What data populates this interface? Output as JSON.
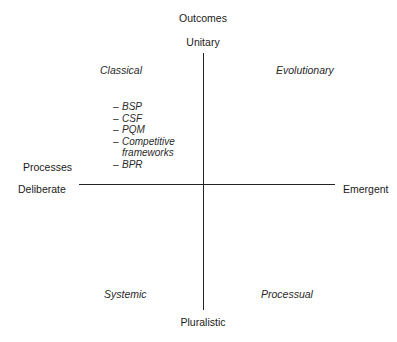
{
  "diagram": {
    "type": "quadrant",
    "vertical_axis": {
      "title": "Outcomes",
      "top": "Unitary",
      "bottom": "Pluralistic"
    },
    "horizontal_axis": {
      "title": "Processes",
      "left": "Deliberate",
      "right": "Emergent"
    },
    "quadrants": {
      "top_left": {
        "label": "Classical",
        "items": [
          {
            "line1": "BSP"
          },
          {
            "line1": "CSF"
          },
          {
            "line1": "PQM"
          },
          {
            "line1": "Competitive",
            "line2": "frameworks"
          },
          {
            "line1": "BPR"
          }
        ]
      },
      "top_right": {
        "label": "Evolutionary"
      },
      "bottom_left": {
        "label": "Systemic"
      },
      "bottom_right": {
        "label": "Processual"
      }
    },
    "dash": "–"
  }
}
